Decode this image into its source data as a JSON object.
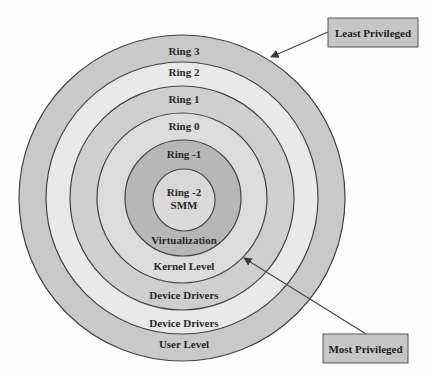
{
  "diagram": {
    "center": {
      "x": 182,
      "y": 198
    },
    "outline_color": "#444444",
    "rings": [
      {
        "id": "ring-3",
        "name": "Ring 3",
        "radius": 163,
        "fill": "#c9c9c9"
      },
      {
        "id": "ring-2",
        "name": "Ring 2",
        "radius": 136,
        "fill": "#e9e9e9"
      },
      {
        "id": "ring-1",
        "name": "Ring 1",
        "radius": 112,
        "fill": "#cfcfcf"
      },
      {
        "id": "ring-0",
        "name": "Ring 0",
        "radius": 85,
        "fill": "#dcdcdc"
      },
      {
        "id": "ring-m1",
        "name": "Ring -1",
        "radius": 58,
        "fill": "#b7b7b7"
      },
      {
        "id": "ring-m2",
        "name": "Ring -2",
        "radius": 31,
        "fill": "#d9d9d9"
      }
    ],
    "top_labels": [
      {
        "text": "Ring 3",
        "x": 184,
        "y": 55
      },
      {
        "text": "Ring 2",
        "x": 184,
        "y": 76
      },
      {
        "text": "Ring 1",
        "x": 184,
        "y": 103
      },
      {
        "text": "Ring 0",
        "x": 184,
        "y": 130
      },
      {
        "text": "Ring -1",
        "x": 184,
        "y": 158
      }
    ],
    "center_labels": [
      {
        "text": "Ring -2",
        "x": 184,
        "y": 196
      },
      {
        "text": "SMM",
        "x": 184,
        "y": 209
      }
    ],
    "bottom_labels": [
      {
        "text": "Virtualization",
        "x": 184,
        "y": 244
      },
      {
        "text": "Kernel Level",
        "x": 184,
        "y": 270
      },
      {
        "text": "Device Drivers",
        "x": 184,
        "y": 299
      },
      {
        "text": "Device Drivers",
        "x": 184,
        "y": 327
      },
      {
        "text": "User Level",
        "x": 184,
        "y": 348
      }
    ]
  },
  "callouts": {
    "least": {
      "label": "Least Privileged",
      "box": {
        "x": 328,
        "y": 18,
        "w": 90,
        "h": 29
      },
      "arrow": {
        "x1": 328,
        "y1": 32,
        "x2": 270,
        "y2": 57
      }
    },
    "most": {
      "label": "Most Privileged",
      "box": {
        "x": 323,
        "y": 334,
        "w": 85,
        "h": 29
      },
      "arrow": {
        "x1": 366,
        "y1": 334,
        "x2": 243,
        "y2": 258
      }
    },
    "box_fill": "#c6c6c6",
    "box_stroke": "#555555",
    "arrow_color": "#4a4a4a"
  }
}
